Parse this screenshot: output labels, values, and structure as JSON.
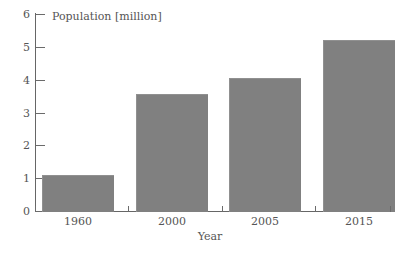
{
  "chart_data": {
    "type": "bar",
    "title": "",
    "categories": [
      "1960",
      "2000",
      "2005",
      "2015"
    ],
    "values": [
      1.1,
      3.55,
      4.05,
      5.2
    ],
    "series": [
      {
        "name": "Population",
        "values": [
          1.1,
          3.55,
          4.05,
          5.2
        ]
      }
    ],
    "xlabel": "Year",
    "ylabel": "Population [million]",
    "ylim": [
      0,
      6
    ],
    "yticks": [
      0,
      1,
      2,
      3,
      4,
      5,
      6
    ],
    "ytick_labels": [
      "0",
      "1",
      "2",
      "3",
      "4",
      "5",
      "6"
    ],
    "xtick_labels": [
      "1960",
      "2000",
      "2005",
      "2015"
    ],
    "grid": false,
    "legend": false,
    "bar_color": "#808080",
    "axis_color": "#666666",
    "text_color": "#555555",
    "background": "#ffffff"
  }
}
